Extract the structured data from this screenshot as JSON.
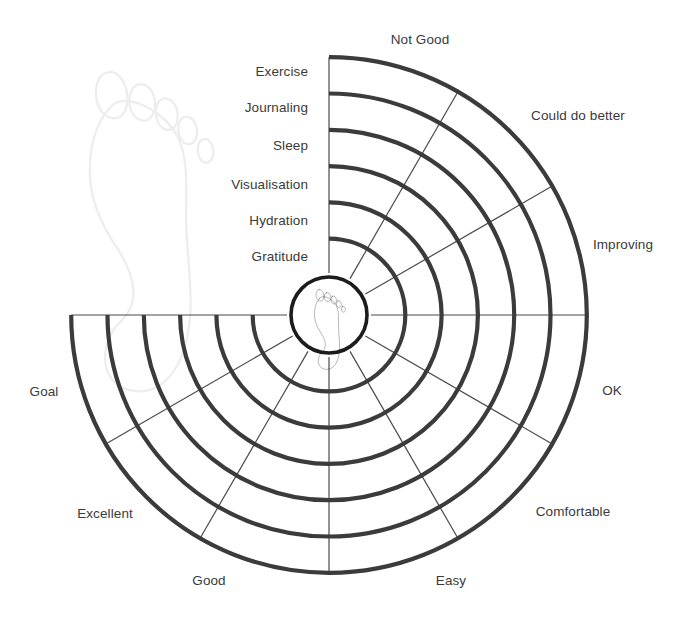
{
  "chart_data": {
    "type": "radar",
    "title": "",
    "center": {
      "x": 329,
      "y": 315
    },
    "hub_radius": 40,
    "ring_step": 36.3,
    "sweep_start_deg": -90,
    "sweep_end_deg": 180,
    "ring_count": 6,
    "sector_count": 9,
    "ring_labels": [
      "Exercise",
      "Journaling",
      "Sleep",
      "Visualisation",
      "Hydration",
      "Gratitude"
    ],
    "ring_label_positions": [
      {
        "x": 308,
        "y": 72
      },
      {
        "x": 308,
        "y": 108
      },
      {
        "x": 308,
        "y": 146
      },
      {
        "x": 308,
        "y": 185
      },
      {
        "x": 308,
        "y": 221
      },
      {
        "x": 308,
        "y": 257
      }
    ],
    "sector_labels": [
      "Not Good",
      "Could do better",
      "Improving",
      "OK",
      "Comfortable",
      "Easy",
      "Good",
      "Excellent",
      "Goal"
    ],
    "sector_label_positions": [
      {
        "x": 420,
        "y": 40
      },
      {
        "x": 578,
        "y": 116
      },
      {
        "x": 623,
        "y": 245
      },
      {
        "x": 612,
        "y": 391
      },
      {
        "x": 573,
        "y": 512
      },
      {
        "x": 451,
        "y": 581
      },
      {
        "x": 209,
        "y": 581
      },
      {
        "x": 105,
        "y": 514
      },
      {
        "x": 44,
        "y": 392
      }
    ],
    "colors": {
      "arc": "#3b3b3b",
      "spoke": "#4a4a4a",
      "hub_outline": "#1c1c1c",
      "label_text": "#3a3a3a",
      "watermark": "#ededed",
      "background": "#ffffff"
    },
    "center_icon": "footprint-icon",
    "watermark_icon": "footprint-watermark-icon"
  }
}
